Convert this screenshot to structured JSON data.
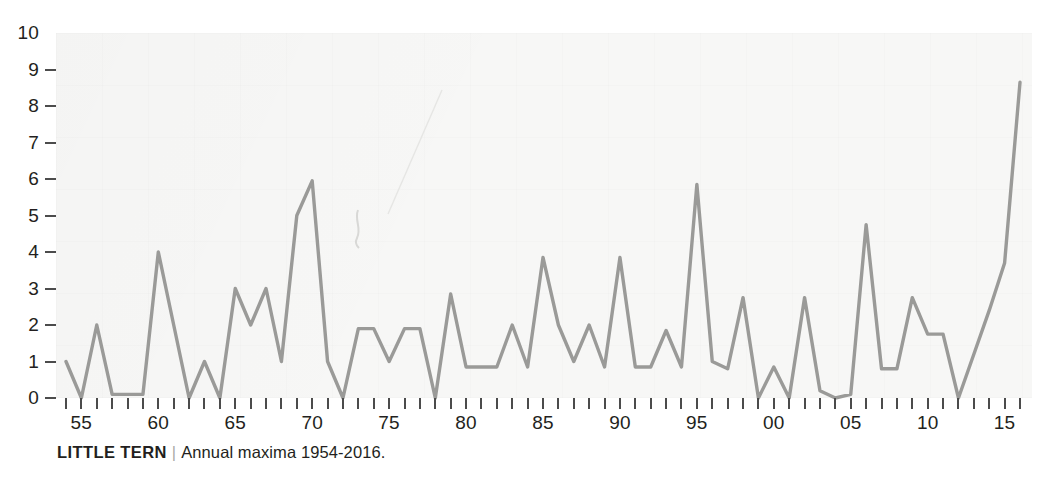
{
  "caption": {
    "species": "LITTLE TERN",
    "separator": "|",
    "description": "Annual maxima 1954-2016."
  },
  "axes": {
    "y_ticks": [
      10,
      9,
      8,
      7,
      6,
      5,
      4,
      3,
      2,
      1,
      0
    ],
    "y_min": 0,
    "y_max": 10,
    "x_labels": [
      "55",
      "60",
      "65",
      "70",
      "75",
      "80",
      "85",
      "90",
      "95",
      "00",
      "05",
      "10",
      "15"
    ],
    "x_label_years": [
      1955,
      1960,
      1965,
      1970,
      1975,
      1980,
      1985,
      1990,
      1995,
      2000,
      2005,
      2010,
      2015
    ],
    "x_min": 1954,
    "x_max": 2016
  },
  "style": {
    "line_color": "#9a9a98",
    "plot_background": "#f7f7f6",
    "text_color": "#231f20",
    "tick_color": "#4c4c4c"
  },
  "chart_data": {
    "type": "line",
    "title": "LITTLE TERN",
    "subtitle": "Annual maxima 1954-2016.",
    "xlabel": "",
    "ylabel": "",
    "xlim": [
      1954,
      2016
    ],
    "ylim": [
      0,
      10
    ],
    "grid": false,
    "legend": "none",
    "x": [
      1954,
      1955,
      1956,
      1957,
      1958,
      1959,
      1960,
      1961,
      1962,
      1963,
      1964,
      1965,
      1966,
      1967,
      1968,
      1969,
      1970,
      1971,
      1972,
      1973,
      1974,
      1975,
      1976,
      1977,
      1978,
      1979,
      1980,
      1981,
      1982,
      1983,
      1984,
      1985,
      1986,
      1987,
      1988,
      1989,
      1990,
      1991,
      1992,
      1993,
      1994,
      1995,
      1996,
      1997,
      1998,
      1999,
      2000,
      2001,
      2002,
      2003,
      2004,
      2005,
      2006,
      2007,
      2008,
      2009,
      2010,
      2011,
      2012,
      2013,
      2014,
      2015,
      2016
    ],
    "categories": [
      "1954",
      "1955",
      "1956",
      "1957",
      "1958",
      "1959",
      "1960",
      "1961",
      "1962",
      "1963",
      "1964",
      "1965",
      "1966",
      "1967",
      "1968",
      "1969",
      "1970",
      "1971",
      "1972",
      "1973",
      "1974",
      "1975",
      "1976",
      "1977",
      "1978",
      "1979",
      "1980",
      "1981",
      "1982",
      "1983",
      "1984",
      "1985",
      "1986",
      "1987",
      "1988",
      "1989",
      "1990",
      "1991",
      "1992",
      "1993",
      "1994",
      "1995",
      "1996",
      "1997",
      "1998",
      "1999",
      "2000",
      "2001",
      "2002",
      "2003",
      "2004",
      "2005",
      "2006",
      "2007",
      "2008",
      "2009",
      "2010",
      "2011",
      "2012",
      "2013",
      "2014",
      "2015",
      "2016"
    ],
    "values": [
      1.0,
      0.0,
      2.0,
      0.1,
      0.1,
      0.1,
      4.0,
      2.0,
      0.0,
      1.0,
      0.0,
      3.0,
      2.0,
      3.0,
      1.0,
      5.0,
      5.95,
      1.0,
      0.0,
      1.9,
      1.9,
      1.0,
      1.9,
      1.9,
      0.0,
      2.85,
      0.85,
      0.85,
      0.85,
      2.0,
      0.85,
      3.85,
      2.0,
      1.0,
      2.0,
      0.85,
      3.85,
      0.85,
      0.85,
      1.85,
      0.85,
      5.85,
      1.0,
      0.8,
      2.75,
      0.0,
      0.85,
      0.0,
      2.75,
      0.2,
      0.0,
      0.1,
      4.75,
      0.8,
      0.8,
      2.75,
      1.75,
      1.75,
      0.0,
      1.2,
      2.4,
      3.7,
      8.65
    ],
    "series": [
      {
        "name": "Little Tern annual maxima",
        "values": [
          1.0,
          0.0,
          2.0,
          0.1,
          0.1,
          0.1,
          4.0,
          2.0,
          0.0,
          1.0,
          0.0,
          3.0,
          2.0,
          3.0,
          1.0,
          5.0,
          5.95,
          1.0,
          0.0,
          1.9,
          1.9,
          1.0,
          1.9,
          1.9,
          0.0,
          2.85,
          0.85,
          0.85,
          0.85,
          2.0,
          0.85,
          3.85,
          2.0,
          1.0,
          2.0,
          0.85,
          3.85,
          0.85,
          0.85,
          1.85,
          0.85,
          5.85,
          1.0,
          0.8,
          2.75,
          0.0,
          0.85,
          0.0,
          2.75,
          0.2,
          0.0,
          0.1,
          4.75,
          0.8,
          0.8,
          2.75,
          1.75,
          1.75,
          0.0,
          1.2,
          2.4,
          3.7,
          8.65
        ]
      }
    ]
  }
}
